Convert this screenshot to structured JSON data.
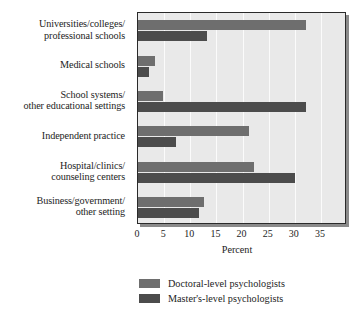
{
  "chart_data": {
    "type": "bar",
    "orientation": "horizontal",
    "title": "",
    "xlabel": "Percent",
    "ylabel": "",
    "xlim": [
      0,
      40
    ],
    "xticks": [
      0,
      5,
      10,
      15,
      20,
      25,
      30,
      35
    ],
    "grid": true,
    "legend_position": "bottom",
    "categories": [
      "Universities/colleges/\nprofessional schools",
      "Medical schools",
      "School systems/\nother educational settings",
      "Independent practice",
      "Hospital/clinics/\ncounseling centers",
      "Business/government/\nother setting"
    ],
    "category_lines": [
      [
        "Universities/colleges/",
        "professional schools"
      ],
      [
        "Medical schools"
      ],
      [
        "School systems/",
        "other educational settings"
      ],
      [
        "Independent practice"
      ],
      [
        "Hospital/clinics/",
        "counseling centers"
      ],
      [
        "Business/government/",
        "other setting"
      ]
    ],
    "series": [
      {
        "name": "Doctoral-level psychologists",
        "color": "#6e6e6e",
        "values": [
          32.2,
          3.3,
          4.7,
          21.3,
          22.2,
          12.7
        ]
      },
      {
        "name": "Master's-level psychologists",
        "color": "#4c4c4c",
        "values": [
          13.3,
          2.2,
          32.2,
          7.3,
          30.0,
          11.6
        ]
      }
    ]
  },
  "axis": {
    "x_title": "Percent",
    "tick_labels": [
      "0",
      "5",
      "10",
      "15",
      "20",
      "25",
      "30",
      "35"
    ]
  },
  "legend": {
    "entries": [
      {
        "label": "Doctoral-level psychologists",
        "swatch": "doctoral-swatch"
      },
      {
        "label": "Master's-level psychologists",
        "swatch": "masters-swatch"
      }
    ]
  },
  "colors": {
    "doctoral": "#6e6e6e",
    "masters": "#4c4c4c",
    "plot_background": "#e9e9e9",
    "gridline": "#fbfbfb",
    "axis_border": "#2a2a2a",
    "shadow": "#8a8a8a",
    "text": "#1d1d1d"
  }
}
